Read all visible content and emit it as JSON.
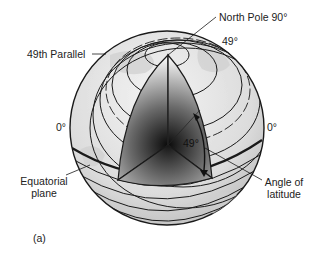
{
  "figure": {
    "panel_label": "(a)",
    "labels": {
      "north_pole": "North Pole  90°",
      "latitude_49_top": "49°",
      "parallel_49": "49th Parallel",
      "equator_left": "0°",
      "equator_right": "0°",
      "wedge_angle": "49°",
      "equatorial_plane_line1": "Equatorial",
      "equatorial_plane_line2": "plane",
      "angle_of_latitude_line1": "Angle of",
      "angle_of_latitude_line2": "latitude"
    },
    "colors": {
      "background": "#ffffff",
      "globe_fill": "#e6e6e6",
      "line": "#1a1a1a",
      "core_dark": "#111111"
    }
  }
}
